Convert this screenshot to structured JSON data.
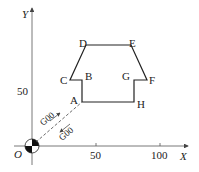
{
  "axes": {
    "x_label": "X",
    "y_label": "Y",
    "origin_label": "O",
    "x_ticks": [
      "50",
      "100"
    ],
    "y_ticks": [
      "50"
    ]
  },
  "points": {
    "A": "A",
    "B": "B",
    "C": "C",
    "D": "D",
    "E": "E",
    "F": "F",
    "G": "G",
    "H": "H"
  },
  "moves": {
    "approach": "G00",
    "retract": "G00"
  },
  "colors": {
    "line": "#222222",
    "axis": "#555555"
  }
}
